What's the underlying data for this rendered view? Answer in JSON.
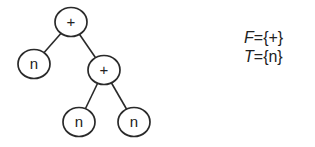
{
  "diagram": {
    "type": "expression-tree",
    "nodes": [
      {
        "id": "root",
        "label": "+",
        "x": 71,
        "y": 22
      },
      {
        "id": "left-leaf",
        "label": "n",
        "x": 34,
        "y": 64
      },
      {
        "id": "right-op",
        "label": "+",
        "x": 104,
        "y": 70
      },
      {
        "id": "bottom-left-leaf",
        "label": "n",
        "x": 79,
        "y": 122
      },
      {
        "id": "bottom-right-leaf",
        "label": "n",
        "x": 134,
        "y": 122
      }
    ],
    "edges": [
      [
        "root",
        "left-leaf"
      ],
      [
        "root",
        "right-op"
      ],
      [
        "right-op",
        "bottom-left-leaf"
      ],
      [
        "right-op",
        "bottom-right-leaf"
      ]
    ],
    "colors": {
      "stroke": "#2a2a2a",
      "text": "#222222",
      "background": "#ffffff"
    }
  },
  "sets": {
    "function_set": {
      "symbol": "F",
      "equals": "=",
      "value": "{+}"
    },
    "terminal_set": {
      "symbol": "T",
      "equals": "=",
      "value": "{n}"
    }
  }
}
